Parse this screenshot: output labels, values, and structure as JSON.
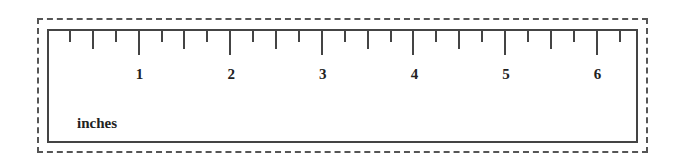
{
  "ruler": {
    "unit_label": "inches",
    "pixels_per_inch": 91.6,
    "origin_x": 0,
    "numbers": [
      "1",
      "2",
      "3",
      "4",
      "5",
      "6"
    ],
    "ticks": [
      {
        "pos": 0.25,
        "type": "short"
      },
      {
        "pos": 0.5,
        "type": "med"
      },
      {
        "pos": 0.75,
        "type": "short"
      },
      {
        "pos": 1.0,
        "type": "long"
      },
      {
        "pos": 1.25,
        "type": "short"
      },
      {
        "pos": 1.5,
        "type": "med"
      },
      {
        "pos": 1.75,
        "type": "short"
      },
      {
        "pos": 2.0,
        "type": "long"
      },
      {
        "pos": 2.25,
        "type": "short"
      },
      {
        "pos": 2.5,
        "type": "med"
      },
      {
        "pos": 2.75,
        "type": "short"
      },
      {
        "pos": 3.0,
        "type": "long"
      },
      {
        "pos": 3.25,
        "type": "short"
      },
      {
        "pos": 3.5,
        "type": "med"
      },
      {
        "pos": 3.75,
        "type": "short"
      },
      {
        "pos": 4.0,
        "type": "long"
      },
      {
        "pos": 4.25,
        "type": "short"
      },
      {
        "pos": 4.5,
        "type": "med"
      },
      {
        "pos": 4.75,
        "type": "short"
      },
      {
        "pos": 5.0,
        "type": "long"
      },
      {
        "pos": 5.25,
        "type": "short"
      },
      {
        "pos": 5.5,
        "type": "med"
      },
      {
        "pos": 5.75,
        "type": "short"
      },
      {
        "pos": 6.0,
        "type": "long"
      },
      {
        "pos": 6.25,
        "type": "short"
      }
    ],
    "line_color": "#444444",
    "border_style": "dashed cut line"
  }
}
